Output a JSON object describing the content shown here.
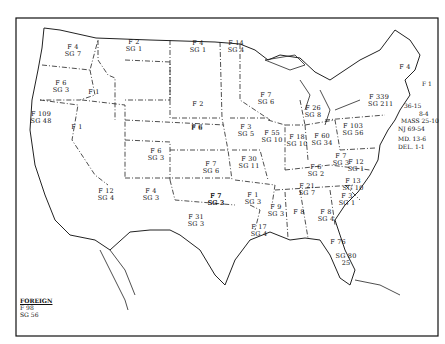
{
  "map": {
    "subject": "United States state map with F / SG counts per state",
    "legend": {
      "title": "FOREIGN",
      "f": "F  98",
      "sg": "SG  56"
    },
    "states": [
      {
        "id": "wa",
        "f": "F 4",
        "sg": "SG 7",
        "x": 72,
        "y": 48
      },
      {
        "id": "or",
        "f": "F 6",
        "sg": "SG 3",
        "x": 60,
        "y": 84
      },
      {
        "id": "id",
        "f": "F 1",
        "sg": "",
        "x": 93,
        "y": 93
      },
      {
        "id": "mt",
        "f": "F 2",
        "sg": "SG 1",
        "x": 133,
        "y": 43
      },
      {
        "id": "ca",
        "f": "F 109",
        "sg": "SG 48",
        "x": 40,
        "y": 115
      },
      {
        "id": "nv",
        "f": "F 1",
        "sg": "",
        "x": 76,
        "y": 128
      },
      {
        "id": "az",
        "f": "F 12",
        "sg": "SG 4",
        "x": 105,
        "y": 192
      },
      {
        "id": "ut",
        "f": "F 6",
        "sg": "SG 3",
        "x": 155,
        "y": 152
      },
      {
        "id": "nm",
        "f": "F 4",
        "sg": "SG 3",
        "x": 150,
        "y": 192
      },
      {
        "id": "wy",
        "f": "F 2",
        "sg": "",
        "x": 197,
        "y": 105
      },
      {
        "id": "co",
        "f": "F 6",
        "sg": "",
        "x": 196,
        "y": 129
      },
      {
        "id": "nd",
        "f": "F 4",
        "sg": "SG 1",
        "x": 197,
        "y": 44
      },
      {
        "id": "sd",
        "f": "F 6",
        "sg": "",
        "x": 196,
        "y": 128
      },
      {
        "id": "ne_st",
        "f": "F 7",
        "sg": "SG 6",
        "x": 210,
        "y": 165
      },
      {
        "id": "ks",
        "f": "F 7",
        "sg": "SG 3",
        "x": 215,
        "y": 197
      },
      {
        "id": "ok",
        "f": "F 7",
        "sg": "SG 3",
        "x": 215,
        "y": 197
      },
      {
        "id": "tx",
        "f": "F 31",
        "sg": "SG 3",
        "x": 195,
        "y": 218
      },
      {
        "id": "mn",
        "f": "F 14",
        "sg": "SG 4",
        "x": 235,
        "y": 44
      },
      {
        "id": "ia",
        "f": "F 3",
        "sg": "SG 5",
        "x": 245,
        "y": 128
      },
      {
        "id": "mo",
        "f": "F 30",
        "sg": "SG 11",
        "x": 248,
        "y": 160
      },
      {
        "id": "ar",
        "f": "F 1",
        "sg": "SG 3",
        "x": 252,
        "y": 196
      },
      {
        "id": "la",
        "f": "F 17",
        "sg": "SG 4",
        "x": 258,
        "y": 228
      },
      {
        "id": "wi",
        "f": "F 7",
        "sg": "SG 6",
        "x": 265,
        "y": 96
      },
      {
        "id": "mi",
        "f": "F 26",
        "sg": "SG 8",
        "x": 312,
        "y": 109
      },
      {
        "id": "il",
        "f": "F 55",
        "sg": "SG 10",
        "x": 271,
        "y": 134
      },
      {
        "id": "in",
        "f": "F 18",
        "sg": "SG 10",
        "x": 296,
        "y": 138
      },
      {
        "id": "oh",
        "f": "F 60",
        "sg": "SG 34",
        "x": 321,
        "y": 137
      },
      {
        "id": "ky",
        "f": "F 6",
        "sg": "SG 2",
        "x": 315,
        "y": 168
      },
      {
        "id": "tn",
        "f": "F 21",
        "sg": "SG 7",
        "x": 306,
        "y": 187
      },
      {
        "id": "ms",
        "f": "F 9",
        "sg": "SG 3",
        "x": 275,
        "y": 208
      },
      {
        "id": "al",
        "f": "F 8",
        "sg": "",
        "x": 298,
        "y": 213
      },
      {
        "id": "ga",
        "f": "F 8",
        "sg": "SG 4",
        "x": 325,
        "y": 213
      },
      {
        "id": "fl",
        "f": "F 76",
        "sg": "",
        "x": 337,
        "y": 243
      },
      {
        "id": "fl2",
        "f": "SG 80",
        "sg": "25",
        "x": 345,
        "y": 257
      },
      {
        "id": "sc",
        "f": "F 3",
        "sg": "SG 1",
        "x": 346,
        "y": 197
      },
      {
        "id": "nc",
        "f": "F 13",
        "sg": "SG 10",
        "x": 352,
        "y": 182
      },
      {
        "id": "va",
        "f": "F 12",
        "sg": "SG 1",
        "x": 355,
        "y": 163
      },
      {
        "id": "wv",
        "f": "F 7",
        "sg": "SG 3",
        "x": 340,
        "y": 157
      },
      {
        "id": "pa",
        "f": "F 103",
        "sg": "SG 56",
        "x": 352,
        "y": 127
      },
      {
        "id": "ny",
        "f": "F 339",
        "sg": "SG 211",
        "x": 378,
        "y": 98
      },
      {
        "id": "me",
        "f": "F 4",
        "sg": "",
        "x": 404,
        "y": 68
      }
    ],
    "northeast_labels": [
      {
        "text": "F 1",
        "sub": "3",
        "x": 422,
        "y": 80
      },
      {
        "text": "36-15",
        "x": 404,
        "y": 102
      },
      {
        "text": "8-4",
        "x": 419,
        "y": 110
      },
      {
        "text": "MASS 25-10",
        "x": 401,
        "y": 117
      },
      {
        "text": "NJ 69-54",
        "x": 398,
        "y": 125
      },
      {
        "text": "MD. 13-6",
        "x": 398,
        "y": 135
      },
      {
        "text": "DEL. 1-1",
        "x": 398,
        "y": 143
      }
    ]
  }
}
